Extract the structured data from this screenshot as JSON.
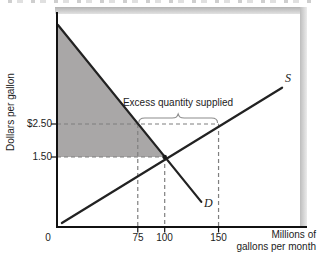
{
  "figure": {
    "y_axis_title": "Dollars per gallon",
    "x_axis_title_line1": "Millions of",
    "x_axis_title_line2": "gallons per month",
    "origin_label": "0",
    "axis_color": "#111111",
    "background": "#ffffff"
  },
  "chart_data": {
    "type": "line",
    "title": "",
    "xlabel": "Millions of gallons per month",
    "ylabel": "Dollars per gallon",
    "x_ticks": [
      {
        "label": "75",
        "q": 75
      },
      {
        "label": "100",
        "q": 100
      },
      {
        "label": "150",
        "q": 150
      }
    ],
    "y_ticks": [
      {
        "label": "$2.50",
        "price": 2.5
      },
      {
        "label": "1.50",
        "price": 1.5
      }
    ],
    "series": [
      {
        "name": "D",
        "role": "demand",
        "color": "#222222",
        "points": [
          {
            "q": 0.9,
            "p": 5.5
          },
          {
            "q": 134,
            "p": 0.14
          }
        ]
      },
      {
        "name": "S",
        "role": "supply",
        "color": "#222222",
        "points": [
          {
            "q": 4.5,
            "p": -0.5
          },
          {
            "q": 209,
            "p": 3.6
          }
        ]
      }
    ],
    "equilibrium": {
      "q": 100,
      "p": 1.5
    },
    "excess_supply": {
      "label": "Excess quantity supplied",
      "price": 2.5,
      "q_from": 75,
      "q_to": 150,
      "quantity": 75
    },
    "shaded_region": {
      "color": "#a9a7a7",
      "points": [
        {
          "q": 0.9,
          "p": 5.5
        },
        {
          "q": 100,
          "p": 1.5
        },
        {
          "q": 0.9,
          "p": 1.5
        }
      ]
    },
    "guides": [
      {
        "type": "h",
        "price": 2.5,
        "q0": 0,
        "q1": 150
      },
      {
        "type": "h",
        "price": 1.5,
        "q0": 0,
        "q1": 100
      },
      {
        "type": "v",
        "q": 75,
        "p0": 2.5,
        "to_axis": true
      },
      {
        "type": "v",
        "q": 100,
        "p0": 1.5,
        "to_axis": true
      },
      {
        "type": "v",
        "q": 150,
        "p0": 2.5,
        "to_axis": true
      }
    ],
    "guide_color": "#7f7f7f",
    "brace_color": "#8c8c8c",
    "axis_ranges": {
      "x_visible": [
        0,
        150
      ],
      "y_visible": [
        1.5,
        2.5
      ]
    }
  }
}
